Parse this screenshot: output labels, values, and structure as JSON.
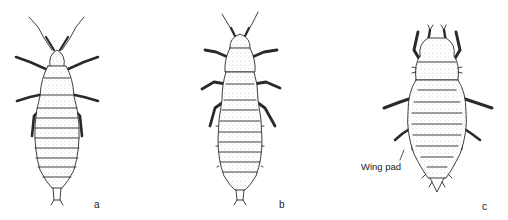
{
  "figure": {
    "panels": [
      {
        "id": "a",
        "letter": "a"
      },
      {
        "id": "b",
        "letter": "b"
      },
      {
        "id": "c",
        "letter": "c",
        "annotation": "Wing pad"
      }
    ],
    "colors": {
      "ink": "#2a2a2a",
      "stipple": "#9a9a9a",
      "background": "#ffffff"
    }
  }
}
